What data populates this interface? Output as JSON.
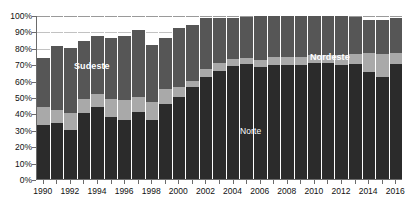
{
  "chart_data": {
    "type": "bar",
    "stacked": true,
    "title": "",
    "subtitle": "",
    "xlabel": "",
    "ylabel": "",
    "ylim": [
      0,
      100
    ],
    "grid": true,
    "legend_position": "in-plot-annotations",
    "categories": [
      "1990",
      "1991",
      "1992",
      "1993",
      "1994",
      "1995",
      "1996",
      "1997",
      "1998",
      "1999",
      "2000",
      "2001",
      "2002",
      "2003",
      "2004",
      "2005",
      "2006",
      "2007",
      "2008",
      "2009",
      "2010",
      "2011",
      "2012",
      "2013",
      "2014",
      "2015",
      "2016"
    ],
    "x_tick_labels": [
      "1990",
      "1992",
      "1994",
      "1996",
      "1998",
      "2000",
      "2002",
      "2004",
      "2006",
      "2008",
      "2010",
      "2012",
      "2014",
      "2016"
    ],
    "y_tick_labels": [
      "0%",
      "10%",
      "20%",
      "30%",
      "40%",
      "50%",
      "60%",
      "70%",
      "80%",
      "90%",
      "100%"
    ],
    "y_tick_values": [
      0,
      10,
      20,
      30,
      40,
      50,
      60,
      70,
      80,
      90,
      100
    ],
    "series": [
      {
        "name": "Norte",
        "color": "#2b2b2b",
        "values": [
          33,
          34,
          30,
          40,
          44,
          38,
          36,
          41,
          36,
          46,
          50,
          56,
          62,
          66,
          69,
          70,
          69,
          70,
          70,
          70,
          71,
          71,
          70,
          70,
          65,
          62,
          70
        ]
      },
      {
        "name": "Nordeste",
        "color": "#a9a9a9",
        "values": [
          11,
          8,
          10,
          9,
          8,
          11,
          12,
          9,
          11,
          9,
          6,
          4,
          5,
          5,
          4,
          4,
          4,
          5,
          5,
          5,
          5,
          5,
          6,
          6,
          12,
          14,
          7
        ]
      },
      {
        "name": "Sudeste",
        "color": "#565656",
        "values": [
          30,
          39,
          40,
          35,
          35,
          37,
          39,
          41,
          35,
          31,
          36,
          34,
          31,
          27,
          25,
          25,
          27,
          25,
          25,
          25,
          24,
          24,
          24,
          23,
          20,
          21,
          21
        ]
      }
    ],
    "series_labels": [
      {
        "name": "Sudeste",
        "text": "Sudeste",
        "style": "bold"
      },
      {
        "name": "Nordeste",
        "text": "Nordeste",
        "style": "bold"
      },
      {
        "name": "Norte",
        "text": "Norte",
        "style": "thin"
      }
    ]
  }
}
